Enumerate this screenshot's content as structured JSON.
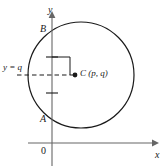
{
  "figure": {
    "type": "geometry-diagram",
    "background_color": "#ffffff",
    "stroke_color": "#1a1a1a",
    "axes": {
      "y_axis_label": "y",
      "x_axis_label": "x",
      "origin_label": "0"
    },
    "labels": {
      "point_b": "B",
      "point_a": "A",
      "line_y_equals_q": "y = q",
      "center_point": "C (p, q)"
    },
    "geometry": {
      "circle": {
        "center_x": 81,
        "center_y": 75,
        "radius": 53
      },
      "center_point": {
        "x": 75,
        "y": 75,
        "name": "C",
        "coordinates": "(p, q)"
      },
      "point_b": {
        "x": 52,
        "y": 28
      },
      "point_a": {
        "x": 52,
        "y": 121
      },
      "y_axis_x": 52,
      "x_axis_y": 143,
      "dashed_line_y": 75,
      "dashed_line_x_start": 17,
      "dashed_line_x_end": 75,
      "right_angle_marker": {
        "x": 52,
        "y": 57,
        "size": 18
      },
      "tick_marks_y": [
        57,
        93
      ]
    }
  }
}
